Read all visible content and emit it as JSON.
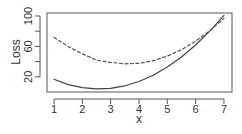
{
  "chart_data": {
    "type": "line",
    "title": "",
    "xlabel": "x",
    "ylabel": "Loss",
    "xlim": [
      0.75,
      7.3
    ],
    "ylim": [
      2,
      104
    ],
    "x_ticks": [
      1,
      2,
      3,
      4,
      5,
      6,
      7
    ],
    "y_ticks": [
      20,
      40,
      60,
      80,
      100
    ],
    "y_tick_labels": [
      "20",
      "",
      "60",
      "",
      "100"
    ],
    "grid": false,
    "legend": null,
    "x": [
      1,
      1.5,
      2,
      2.5,
      3,
      3.5,
      4,
      4.5,
      5,
      5.5,
      6,
      6.5,
      7
    ],
    "series": [
      {
        "name": "solid",
        "style": "solid",
        "color": "#444444",
        "values": [
          16.8,
          9.8,
          5.8,
          4.1,
          4.8,
          8.1,
          13.8,
          22.1,
          32.8,
          46.1,
          61.8,
          80.1,
          100.8
        ]
      },
      {
        "name": "dashed",
        "style": "dashed",
        "color": "#555555",
        "values": [
          72.0,
          59.8,
          50.3,
          42.0,
          38.9,
          37.1,
          37.8,
          41.2,
          47.2,
          55.7,
          66.8,
          80.6,
          96.9
        ]
      }
    ]
  },
  "axes": {
    "xlabel": "x",
    "ylabel": "Loss",
    "x_tick_labels": [
      "1",
      "2",
      "3",
      "4",
      "5",
      "6",
      "7"
    ],
    "y_tick_labels": [
      "20",
      "60",
      "100"
    ]
  }
}
